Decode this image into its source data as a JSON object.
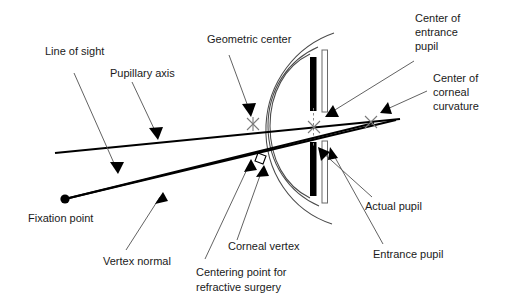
{
  "figure": {
    "background_color": "#ffffff",
    "ink_color": "#000000",
    "outline_color": "#4a4a4a",
    "leader_color": "#5a5a5a",
    "width": 507,
    "height": 303
  },
  "labels": {
    "line_of_sight": "Line of sight",
    "pupillary_axis": "Pupillary axis",
    "geometric_center": "Geometric center",
    "center_of_entrance_pupil_l1": "Center of",
    "center_of_entrance_pupil_l2": "entrance",
    "center_of_entrance_pupil_l3": "pupil",
    "center_of_corneal_curvature_l1": "Center of",
    "center_of_corneal_curvature_l2": "corneal",
    "center_of_corneal_curvature_l3": "curvature",
    "actual_pupil": "Actual pupil",
    "entrance_pupil": "Entrance pupil",
    "fixation_point": "Fixation point",
    "vertex_normal": "Vertex normal",
    "corneal_vertex": "Corneal vertex",
    "centering_point_l1": "Centering point for",
    "centering_point_l2": "refractive surgery"
  },
  "anatomy": {
    "iris_upper": "upper-iris-leaf",
    "iris_lower": "lower-iris-leaf",
    "lens_upper": "upper-lens-edge",
    "lens_lower": "lower-lens-edge",
    "cornea_outer": "cornea-outer-arc",
    "cornea_inner": "cornea-inner-arc",
    "sclera": "sclera-arc"
  },
  "points": {
    "fixation_point": {
      "x": 65,
      "y": 199,
      "label": "Fixation point"
    },
    "geometric_center": {
      "x": 253,
      "y": 124,
      "label": "Geometric center"
    },
    "center_of_entrance_pupil": {
      "x": 315,
      "y": 127,
      "label": "Center of entrance pupil"
    },
    "center_of_corneal_curvature": {
      "x": 371,
      "y": 122,
      "label": "Center of corneal curvature"
    },
    "corneal_vertex": {
      "x": 256,
      "y": 158,
      "label": "Corneal vertex"
    },
    "centering_point": {
      "x": 253,
      "y": 170,
      "label": "Centering point for refractive surgery"
    }
  },
  "axes": [
    {
      "name": "line-of-sight",
      "from": [
        65,
        199
      ],
      "to": [
        396,
        120
      ],
      "label": "Line of sight"
    },
    {
      "name": "pupillary-axis",
      "from": [
        55,
        153
      ],
      "to": [
        400,
        118
      ],
      "label": "Pupillary axis"
    },
    {
      "name": "vertex-normal",
      "from": [
        65,
        199
      ],
      "to": [
        372,
        122
      ],
      "label": "Vertex normal"
    }
  ]
}
